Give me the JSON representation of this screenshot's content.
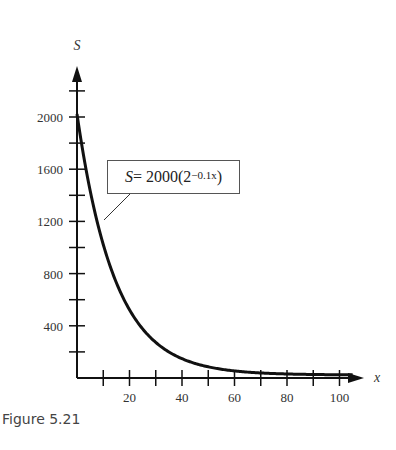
{
  "caption": "Figure 5.21",
  "equation": {
    "lhs": "S",
    "eq": " = 2000(2",
    "exp": "−0.1x",
    "close": ")"
  },
  "chart_data": {
    "type": "line",
    "title": "",
    "xlabel": "x",
    "ylabel": "S",
    "function": "S = 2000(2^(-0.1x))",
    "x_ticks": [
      20,
      40,
      60,
      80,
      100
    ],
    "y_ticks": [
      400,
      800,
      1200,
      1600,
      2000
    ],
    "xlim": [
      0,
      105
    ],
    "ylim": [
      0,
      2300
    ],
    "grid": false,
    "series": [
      {
        "name": "S = 2000(2^-0.1x)",
        "x": [
          0,
          10,
          20,
          30,
          40,
          50,
          60,
          70,
          80,
          90,
          100,
          105
        ],
        "values": [
          2000,
          1000,
          500,
          250,
          125,
          62.5,
          31.25,
          15.6,
          7.8,
          3.9,
          2.0,
          1.4
        ]
      }
    ],
    "annotation": "S = 2000(2^{-0.1x})"
  }
}
